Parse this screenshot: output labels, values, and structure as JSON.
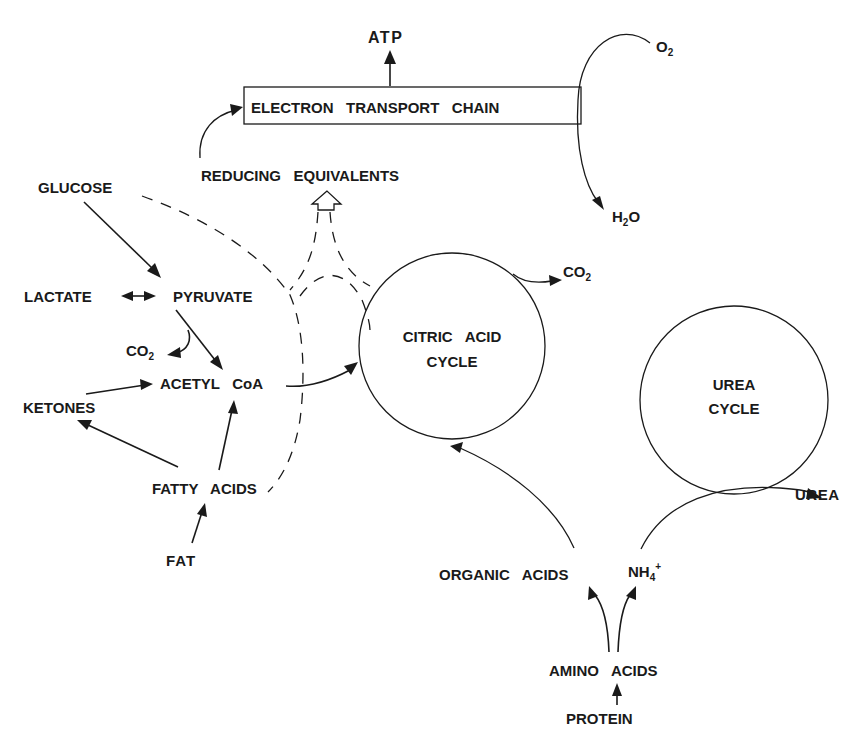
{
  "diagram": {
    "nodes": {
      "atp": "ATP",
      "etc": "ELECTRON   TRANSPORT   CHAIN",
      "o2": "O",
      "o2_sub": "2",
      "h2o_h": "H",
      "h2o_sub": "2",
      "h2o_o": "O",
      "reducing_equivalents": "REDUCING   EQUIVALENTS",
      "glucose": "GLUCOSE",
      "lactate": "LACTATE",
      "pyruvate": "PYRUVATE",
      "co2_pyruvate": "CO",
      "co2_pyruvate_sub": "2",
      "acetyl_coa": "ACETYL   CoA",
      "ketones": "KETONES",
      "fatty_acids": "FATTY   ACIDS",
      "fat": "FAT",
      "citric_acid_cycle_line1": "CITRIC   ACID",
      "citric_acid_cycle_line2": "CYCLE",
      "co2_cycle": "CO",
      "co2_cycle_sub": "2",
      "urea_cycle_line1": "UREA",
      "urea_cycle_line2": "CYCLE",
      "urea": "UREA",
      "organic_acids": "ORGANIC   ACIDS",
      "nh4": "NH",
      "nh4_sub": "4",
      "nh4_sup": "+",
      "amino_acids": "AMINO   ACIDS",
      "protein": "PROTEIN"
    },
    "edges": [
      {
        "from": "GLUCOSE",
        "to": "PYRUVATE",
        "style": "solid"
      },
      {
        "from": "LACTATE",
        "to": "PYRUVATE",
        "style": "bidirectional"
      },
      {
        "from": "PYRUVATE",
        "to": "ACETYL CoA",
        "style": "solid"
      },
      {
        "from": "PYRUVATE",
        "to": "CO2",
        "style": "solid"
      },
      {
        "from": "KETONES",
        "to": "ACETYL CoA",
        "style": "solid"
      },
      {
        "from": "FATTY ACIDS",
        "to": "KETONES",
        "style": "solid"
      },
      {
        "from": "FATTY ACIDS",
        "to": "ACETYL CoA",
        "style": "solid"
      },
      {
        "from": "FAT",
        "to": "FATTY ACIDS",
        "style": "solid"
      },
      {
        "from": "ACETYL CoA",
        "to": "CITRIC ACID CYCLE",
        "style": "solid"
      },
      {
        "from": "CITRIC ACID CYCLE",
        "to": "CO2",
        "style": "solid"
      },
      {
        "from": "GLUCOSE",
        "to": "REDUCING EQUIVALENTS",
        "style": "dashed"
      },
      {
        "from": "FATTY ACIDS",
        "to": "REDUCING EQUIVALENTS",
        "style": "dashed"
      },
      {
        "from": "CITRIC ACID CYCLE",
        "to": "REDUCING EQUIVALENTS",
        "style": "dashed"
      },
      {
        "from": "REDUCING EQUIVALENTS",
        "to": "ELECTRON TRANSPORT CHAIN",
        "style": "solid"
      },
      {
        "from": "ELECTRON TRANSPORT CHAIN",
        "to": "ATP",
        "style": "solid"
      },
      {
        "from": "O2",
        "to": "H2O",
        "style": "solid"
      },
      {
        "from": "PROTEIN",
        "to": "AMINO ACIDS",
        "style": "solid"
      },
      {
        "from": "AMINO ACIDS",
        "to": "ORGANIC ACIDS",
        "style": "solid"
      },
      {
        "from": "AMINO ACIDS",
        "to": "NH4+",
        "style": "solid"
      },
      {
        "from": "ORGANIC ACIDS",
        "to": "CITRIC ACID CYCLE",
        "style": "solid"
      },
      {
        "from": "NH4+",
        "to": "UREA",
        "style": "solid",
        "via": "UREA CYCLE"
      }
    ]
  }
}
